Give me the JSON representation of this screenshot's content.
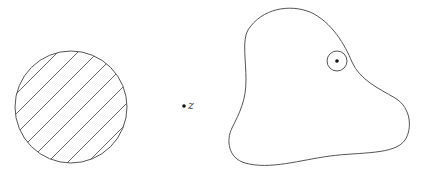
{
  "diagram": {
    "point_label": "z",
    "shapes": [
      {
        "id": "hatched-disk",
        "description": "disk filled with diagonal hatching"
      },
      {
        "id": "point-z",
        "description": "isolated point labeled z"
      },
      {
        "id": "region",
        "description": "irregular closed region containing a small circle around a point"
      }
    ],
    "colors": {
      "stroke": "#555555",
      "background": "#ffffff",
      "point": "#111111"
    }
  }
}
